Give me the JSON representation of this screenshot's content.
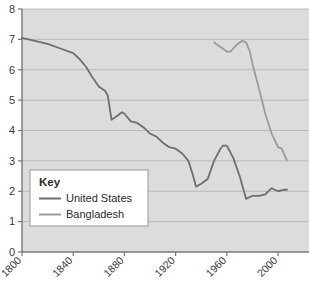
{
  "chart_data": {
    "type": "line",
    "title": "",
    "subtitle": "",
    "xlabel": "",
    "ylabel": "",
    "xlim": [
      1800,
      2007
    ],
    "ylim": [
      0,
      8
    ],
    "grid": true,
    "grid_axis": "y",
    "legend_position": "inside-bottom-left",
    "legend_title": "Key",
    "xticks": [
      1800,
      1840,
      1880,
      1920,
      1960,
      2000
    ],
    "xtick_labels": [
      "1800",
      "1840",
      "1880",
      "1920",
      "1960",
      "2000"
    ],
    "xtick_rotation": 45,
    "yticks": [
      0,
      1,
      2,
      3,
      4,
      5,
      6,
      7,
      8
    ],
    "ytick_labels": [
      "0",
      "1",
      "2",
      "3",
      "4",
      "5",
      "6",
      "7",
      "8"
    ],
    "series": [
      {
        "name": "United States",
        "color": "#6e6e6e",
        "x": [
          1800,
          1810,
          1820,
          1830,
          1840,
          1845,
          1850,
          1855,
          1860,
          1865,
          1867,
          1870,
          1875,
          1878,
          1880,
          1885,
          1890,
          1895,
          1900,
          1905,
          1910,
          1915,
          1920,
          1925,
          1930,
          1933,
          1936,
          1940,
          1945,
          1950,
          1955,
          1957,
          1960,
          1965,
          1970,
          1975,
          1980,
          1985,
          1990,
          1995,
          2000,
          2005,
          2007
        ],
        "values": [
          7.05,
          6.95,
          6.85,
          6.7,
          6.55,
          6.35,
          6.1,
          5.75,
          5.45,
          5.3,
          5.15,
          4.35,
          4.5,
          4.6,
          4.55,
          4.3,
          4.25,
          4.1,
          3.9,
          3.8,
          3.6,
          3.45,
          3.4,
          3.25,
          3.0,
          2.6,
          2.15,
          2.25,
          2.4,
          3.0,
          3.4,
          3.5,
          3.5,
          3.1,
          2.5,
          1.75,
          1.85,
          1.85,
          1.9,
          2.1,
          2.0,
          2.05,
          2.05
        ]
      },
      {
        "name": "Bangladesh",
        "color": "#9b9b9b",
        "x": [
          1950,
          1955,
          1960,
          1963,
          1966,
          1970,
          1972,
          1975,
          1978,
          1980,
          1985,
          1990,
          1995,
          2000,
          2003,
          2005,
          2007
        ],
        "values": [
          6.9,
          6.75,
          6.6,
          6.6,
          6.75,
          6.9,
          6.95,
          6.9,
          6.6,
          6.2,
          5.4,
          4.55,
          3.9,
          3.45,
          3.4,
          3.2,
          3.02
        ]
      }
    ]
  },
  "legend": {
    "title": "Key",
    "entries": [
      {
        "label": "United States",
        "color": "#6e6e6e"
      },
      {
        "label": "Bangladesh",
        "color": "#9b9b9b"
      }
    ]
  },
  "style": {
    "plot_background": "#dcdcdc",
    "grid_color": "#b4b4b4",
    "axis_color": "#808080",
    "legend_background": "#ffffff",
    "legend_border": "#9a9a9a",
    "text_color": "#3a3a3a"
  }
}
